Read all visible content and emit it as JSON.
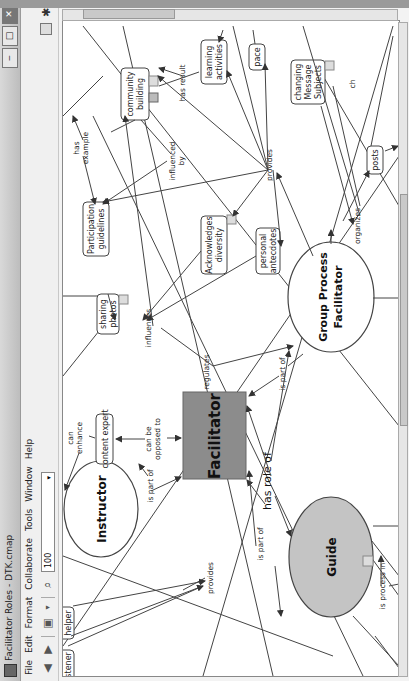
{
  "window": {
    "title": "Facilitator Roles - DTK.cmap",
    "buttons": {
      "minimize": "‒",
      "maximize": "□",
      "close": "✕"
    }
  },
  "menubar": {
    "items": [
      "File",
      "Edit",
      "Format",
      "Collaborate",
      "Tools",
      "Window",
      "Help"
    ]
  },
  "toolbar": {
    "back_icon": "◀",
    "forward_icon": "▶",
    "view_icon": "▣",
    "zoom_icon": "⌕",
    "zoom_value": "100",
    "dropdown_icon": "▾"
  },
  "concept_map": {
    "concepts": {
      "facilitator": "Facilitator",
      "instructor": "Instructor",
      "guide": "Guide",
      "group_process_facilitator_line1": "Group Process",
      "group_process_facilitator_line2": "Facilitator",
      "content_expert": "content expert",
      "participation_guidelines_line1": "Participation",
      "participation_guidelines_line2": "guidelines",
      "community_building_line1": "community",
      "community_building_line2": "building",
      "learning_activities_line1": "learning",
      "learning_activities_line2": "activities",
      "pace": "pace",
      "changing_message_subjects_line1": "changing",
      "changing_message_subjects_line2": "Message",
      "changing_message_subjects_line3": "Subjects",
      "posts": "posts",
      "acknowledges_diversity_line1": "Acknowledges",
      "acknowledges_diversity_line2": "diversity",
      "personal_antecdotes_line1": "personal",
      "personal_antecdotes_line2": "antecdotes",
      "sharing_photos_line1": "sharing",
      "sharing_photos_line2": "photos",
      "helper": "helper",
      "listener_partial": "istener"
    },
    "linking_phrases": {
      "has_role_of": "has role of",
      "is_part_of_instructor": "is part of",
      "is_part_of_guide": "is part of",
      "is_part_of_gpf": "is part of",
      "can_be_opposed_to_line1": "can be",
      "can_be_opposed_to_line2": "opposed to",
      "can_enhance_line1": "can",
      "can_enhance_line2": "enhance",
      "provides_bottom": "provides",
      "provides_top": "provides",
      "regulates": "regulates",
      "influences": "influences",
      "influenced_by_line1": "influenced",
      "influenced_by_line2": "by",
      "has_example_line1": "has",
      "has_example_line2": "example",
      "has_result_line1": "has result",
      "organizes": "organizes",
      "is_process_in": "is process in",
      "partial_ch": "ch"
    },
    "colors": {
      "facilitator_fill": "#8c8c8c",
      "guide_fill": "#c4c4c4",
      "ellipse_fill": "#ffffff",
      "line": "#444444"
    }
  }
}
